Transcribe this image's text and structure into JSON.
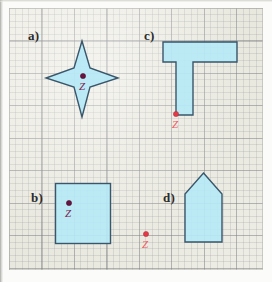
{
  "figure": {
    "background_color": "#ecebe3",
    "shape_fill_color": "#b6e9f6",
    "shape_stroke_color": "#39566b",
    "dot_dark_color": "#6b1240",
    "dot_red_color": "#e03b48"
  },
  "panels": [
    {
      "key": "a",
      "label": "a)",
      "shape_name": "four-pointed-star",
      "point_label": "Z",
      "point_color": "dark",
      "point_inside_shape": true
    },
    {
      "key": "b",
      "label": "b)",
      "shape_name": "square",
      "point_label": "Z",
      "point_color": "dark",
      "point_inside_shape": true
    },
    {
      "key": "c",
      "label": "c)",
      "shape_name": "t-shape",
      "point_label": "Z",
      "point_color": "red",
      "point_inside_shape": false
    },
    {
      "key": "d",
      "label": "d)",
      "shape_name": "house-pentagon",
      "point_label": "Z",
      "point_color": "red",
      "point_inside_shape": false
    }
  ]
}
